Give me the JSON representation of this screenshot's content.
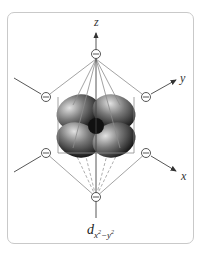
{
  "diagram": {
    "type": "octahedral crystal field d-orbital",
    "axes": [
      {
        "name": "z",
        "label": "z"
      },
      {
        "name": "y",
        "label": "y"
      },
      {
        "name": "x",
        "label": "x"
      }
    ],
    "ligand_symbol": "⊖",
    "ligand_count": 6,
    "caption": {
      "base": "d",
      "subscript_x": "x",
      "sup1": "2",
      "minus": "−",
      "subscript_y": "y",
      "sup2": "2"
    },
    "colors": {
      "border": "#c9c9c9",
      "lines": "#8c8c8c",
      "axis": "#444444",
      "lobe_light": "#d8d8d8",
      "lobe_dark": "#1a1a1a"
    }
  }
}
